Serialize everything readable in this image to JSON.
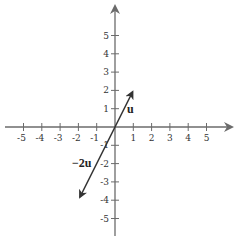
{
  "diagram": {
    "type": "coordinate-plane-vectors",
    "axes": {
      "x_ticks": [
        "-5",
        "-4",
        "-3",
        "-2",
        "-1",
        "1",
        "2",
        "3",
        "4",
        "5"
      ],
      "y_ticks": [
        "5",
        "4",
        "3",
        "2",
        "1",
        "-1",
        "-2",
        "-3",
        "-4",
        "-5"
      ],
      "color": "#666666"
    },
    "vectors": [
      {
        "label": "u",
        "from": [
          0,
          0
        ],
        "to": [
          1,
          2
        ],
        "color": "#333333"
      },
      {
        "label": "−2u",
        "from": [
          0,
          0
        ],
        "to": [
          -2,
          -4
        ],
        "color": "#333333"
      }
    ]
  }
}
